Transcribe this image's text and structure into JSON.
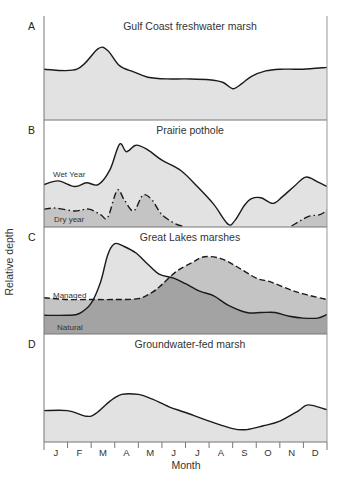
{
  "chart_data": {
    "type": "area",
    "ylabel": "Relative depth",
    "xlabel": "Month",
    "categories": [
      "J",
      "F",
      "M",
      "A",
      "M",
      "J",
      "J",
      "A",
      "S",
      "O",
      "N",
      "D"
    ],
    "colors": {
      "light": "#e2e2e2",
      "medium": "#c4c4c4",
      "dark": "#a3a3a3",
      "line": "#1a1a1a",
      "frame": "#777777"
    },
    "panels": [
      {
        "letter": "A",
        "title": "Gulf Coast freshwater marsh",
        "series": [
          {
            "name": "Water depth",
            "style": "solid",
            "x": [
              0,
              1.4,
              2.3,
              2.7,
              3.2,
              3.8,
              4.4,
              5.2,
              6.0,
              7.0,
              7.6,
              8.0,
              8.4,
              8.8,
              9.4,
              10.0,
              10.6,
              11.0,
              12.0
            ],
            "values": [
              0.56,
              0.56,
              0.79,
              0.77,
              0.6,
              0.53,
              0.47,
              0.45,
              0.45,
              0.44,
              0.41,
              0.34,
              0.4,
              0.48,
              0.54,
              0.56,
              0.56,
              0.56,
              0.58
            ]
          }
        ]
      },
      {
        "letter": "B",
        "title": "Prairie pothole",
        "series": [
          {
            "name": "Wet Year",
            "style": "solid",
            "x": [
              0,
              0.6,
              1.3,
              1.8,
              2.3,
              2.8,
              3.2,
              3.5,
              3.9,
              4.4,
              5.0,
              5.8,
              6.5,
              7.2,
              7.8,
              8.1,
              8.5,
              8.8,
              9.2,
              9.7,
              10.1,
              10.6,
              11.1,
              11.6,
              12.0
            ],
            "values": [
              0.44,
              0.48,
              0.42,
              0.46,
              0.44,
              0.6,
              0.87,
              0.79,
              0.86,
              0.81,
              0.7,
              0.59,
              0.42,
              0.23,
              0.02,
              0.06,
              0.22,
              0.29,
              0.3,
              0.24,
              0.31,
              0.42,
              0.52,
              0.47,
              0.42
            ]
          },
          {
            "name": "Dry year",
            "style": "dashdot",
            "x": [
              0,
              0.5,
              1.3,
              1.9,
              2.4,
              2.7,
              3.1,
              3.4,
              3.8,
              4.2,
              4.6,
              5.0,
              5.6,
              5.9
            ],
            "values": [
              0.18,
              0.19,
              0.16,
              0.18,
              0.12,
              0.09,
              0.38,
              0.28,
              0.16,
              0.33,
              0.27,
              0.12,
              0.02,
              0.0
            ],
            "x2": [
              10.5,
              11.2,
              11.7,
              12.0
            ],
            "values2": [
              0.0,
              0.1,
              0.12,
              0.17
            ]
          }
        ]
      },
      {
        "letter": "C",
        "title": "Great Lakes marshes",
        "series": [
          {
            "name": "Natural",
            "style": "solid",
            "x": [
              0,
              1.0,
              1.5,
              2.0,
              2.4,
              2.7,
              3.0,
              3.4,
              3.9,
              4.4,
              4.9,
              5.5,
              6.0,
              6.6,
              7.2,
              7.8,
              8.6,
              9.2,
              9.8,
              10.4,
              11.0,
              11.6,
              12.0
            ],
            "values": [
              0.19,
              0.19,
              0.21,
              0.32,
              0.55,
              0.84,
              0.96,
              0.93,
              0.86,
              0.74,
              0.63,
              0.59,
              0.53,
              0.45,
              0.4,
              0.3,
              0.22,
              0.22,
              0.22,
              0.18,
              0.16,
              0.16,
              0.2
            ]
          },
          {
            "name": "Managed",
            "style": "dashed",
            "x": [
              0,
              1.0,
              2.0,
              3.0,
              4.0,
              4.6,
              5.0,
              5.6,
              6.3,
              6.8,
              7.5,
              8.2,
              9.0,
              9.6,
              10.3,
              11.0,
              12.0
            ],
            "values": [
              0.38,
              0.36,
              0.36,
              0.36,
              0.37,
              0.44,
              0.52,
              0.66,
              0.76,
              0.82,
              0.8,
              0.71,
              0.59,
              0.55,
              0.48,
              0.42,
              0.36
            ]
          }
        ],
        "regions": [
          "Managed fill medium gray",
          "Natural fill dark gray",
          "Natural excess over Managed light gray"
        ]
      },
      {
        "letter": "D",
        "title": "Groundwater-fed marsh",
        "series": [
          {
            "name": "Water depth",
            "style": "solid",
            "x": [
              0,
              1.0,
              1.8,
              2.2,
              2.8,
              3.3,
              4.0,
              4.6,
              5.3,
              6.0,
              7.0,
              8.0,
              8.6,
              9.3,
              10.0,
              10.8,
              11.2,
              12.0
            ],
            "values": [
              0.32,
              0.32,
              0.26,
              0.29,
              0.42,
              0.49,
              0.49,
              0.44,
              0.36,
              0.3,
              0.21,
              0.13,
              0.12,
              0.16,
              0.21,
              0.32,
              0.38,
              0.33
            ]
          }
        ]
      }
    ],
    "grid": false,
    "legend": "inline labels"
  }
}
